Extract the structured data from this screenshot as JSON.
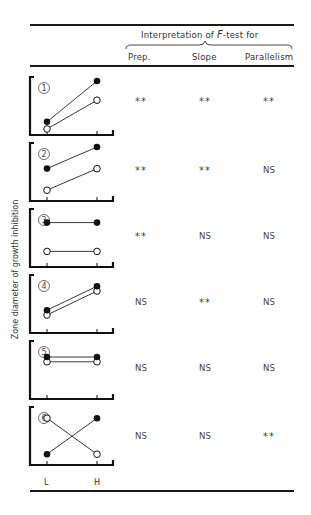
{
  "header": {
    "group_title_pre": "Interpretation of ",
    "group_title_f": "F",
    "group_title_post": "-test for",
    "columns": [
      "Prep.",
      "Slope",
      "Parallelism"
    ]
  },
  "y_axis_label": "Zone diameter of growth inhibition",
  "x_ticks": [
    "L",
    "H"
  ],
  "rows": [
    {
      "id": "1",
      "prep": "**",
      "slope": "**",
      "parallelism": "**"
    },
    {
      "id": "2",
      "prep": "**",
      "slope": "**",
      "parallelism": "NS"
    },
    {
      "id": "3",
      "prep": "**",
      "slope": "NS",
      "parallelism": "NS"
    },
    {
      "id": "4",
      "prep": "NS",
      "slope": "**",
      "parallelism": "NS"
    },
    {
      "id": "5",
      "prep": "NS",
      "slope": "NS",
      "parallelism": "NS"
    },
    {
      "id": "6",
      "prep": "NS",
      "slope": "NS",
      "parallelism": "**"
    }
  ],
  "chart_data": {
    "type": "table",
    "title": "Interpretation of F-test for",
    "columns": [
      "Case",
      "Prep.",
      "Slope",
      "Parallelism"
    ],
    "ylabel": "Zone diameter of growth inhibition",
    "xlabel": "",
    "x_categories": [
      "L",
      "H"
    ],
    "legend": {
      "filled": "preparation A (filled circles)",
      "open": "preparation B (open circles)"
    },
    "panels": [
      {
        "case": 1,
        "filled": [
          0.15,
          1.0
        ],
        "open": [
          0.0,
          0.6
        ],
        "prep": "**",
        "slope": "**",
        "parallelism": "**"
      },
      {
        "case": 2,
        "filled": [
          0.55,
          1.0
        ],
        "open": [
          0.1,
          0.55
        ],
        "prep": "**",
        "slope": "**",
        "parallelism": "NS"
      },
      {
        "case": 3,
        "filled": [
          0.8,
          0.8
        ],
        "open": [
          0.2,
          0.2
        ],
        "prep": "**",
        "slope": "NS",
        "parallelism": "NS"
      },
      {
        "case": 4,
        "filled": [
          0.35,
          0.85
        ],
        "open": [
          0.25,
          0.75
        ],
        "prep": "NS",
        "slope": "**",
        "parallelism": "NS"
      },
      {
        "case": 5,
        "filled": [
          0.75,
          0.75
        ],
        "open": [
          0.65,
          0.65
        ],
        "prep": "NS",
        "slope": "NS",
        "parallelism": "NS"
      },
      {
        "case": 6,
        "filled": [
          0.1,
          0.85
        ],
        "open": [
          0.85,
          0.1
        ],
        "prep": "NS",
        "slope": "NS",
        "parallelism": "**"
      }
    ]
  }
}
